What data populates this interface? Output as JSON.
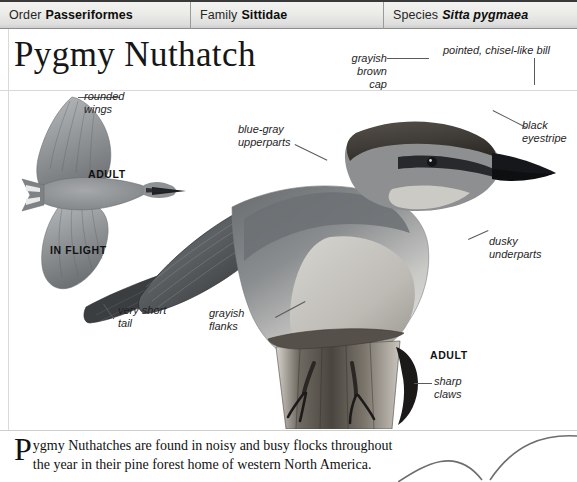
{
  "taxonomy": [
    {
      "rank": "Order",
      "value": "Passeriformes",
      "italic": false
    },
    {
      "rank": "Family",
      "value": "Sittidae",
      "italic": false
    },
    {
      "rank": "Species",
      "value": "Sitta pygmaea",
      "italic": true
    }
  ],
  "title": "Pygmy Nuthatch",
  "labels": {
    "rounded_wings": "rounded\nwings",
    "in_flight_adult": "ADULT",
    "in_flight": "IN FLIGHT",
    "grayish_brown_cap": "grayish\nbrown\ncap",
    "pointed_bill": "pointed, chisel-like bill",
    "black_eyestripe": "black\neyestripe",
    "blue_gray_upperparts": "blue-gray\nupperparts",
    "dusky_underparts": "dusky\nunderparts",
    "very_short_tail": "very short\ntail",
    "grayish_flanks": "grayish\nflanks",
    "perched_adult": "ADULT",
    "sharp_claws": "sharp\nclaws"
  },
  "description": {
    "dropcap": "P",
    "text": "ygmy Nuthatches are found in noisy and busy flocks throughout the year in their pine forest home of western North America."
  },
  "colors": {
    "header_bg": "#ebebe8",
    "header_border": "#8d8d8d",
    "text": "#111111",
    "leader_line": "#5a5a5a",
    "rule": "#d8d8d6"
  }
}
